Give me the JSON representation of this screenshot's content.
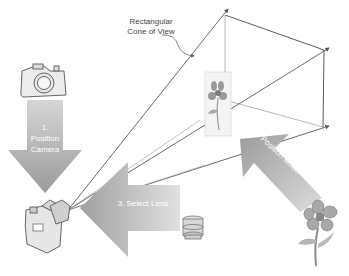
{
  "diagram": {
    "annotation": {
      "line1": "Rectangular",
      "line2": "Cone of View"
    },
    "steps": [
      {
        "number": "1.",
        "line1": "Position",
        "line2": "Camera",
        "direction": "down"
      },
      {
        "label": "2. Position Model",
        "direction": "up-left"
      },
      {
        "label": "3. Select Lens",
        "direction": "left"
      }
    ],
    "icons": [
      "camera-top-icon",
      "camera-main-icon",
      "lens-icon",
      "flower-model-icon",
      "flower-picture-plane-icon"
    ],
    "colors": {
      "arrow_fill": "#a6a6a6",
      "arrow_light": "#d4d4d4",
      "cone_lines": "#555555",
      "background": "#ffffff"
    }
  }
}
